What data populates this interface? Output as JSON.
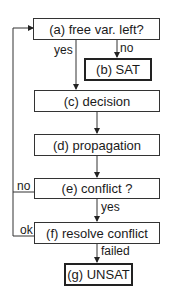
{
  "diagram": {
    "nodes": [
      {
        "id": "a",
        "label": "(a) free var. left?"
      },
      {
        "id": "b",
        "label": "(b) SAT"
      },
      {
        "id": "c",
        "label": "(c) decision"
      },
      {
        "id": "d",
        "label": "(d) propagation"
      },
      {
        "id": "e",
        "label": "(e) conflict ?"
      },
      {
        "id": "f",
        "label": "(f) resolve conflict"
      },
      {
        "id": "g",
        "label": "(g) UNSAT"
      }
    ],
    "edges": [
      {
        "from": "a",
        "to": "c",
        "label": "yes"
      },
      {
        "from": "a",
        "to": "b",
        "label": "no"
      },
      {
        "from": "c",
        "to": "d",
        "label": ""
      },
      {
        "from": "d",
        "to": "e",
        "label": ""
      },
      {
        "from": "e",
        "to": "a",
        "label": "no"
      },
      {
        "from": "e",
        "to": "f",
        "label": "yes"
      },
      {
        "from": "f",
        "to": "a",
        "label": "ok"
      },
      {
        "from": "f",
        "to": "g",
        "label": "failed"
      }
    ]
  }
}
